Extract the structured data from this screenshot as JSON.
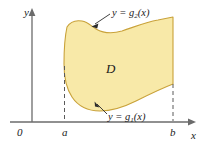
{
  "figure": {
    "axes": {
      "y_axis_label": "y",
      "x_axis_label": "x",
      "origin_label": "0"
    },
    "ticks": {
      "left_bound": "a",
      "right_bound": "b"
    },
    "region": {
      "label": "D",
      "fill_color": "#F8E9A8",
      "stroke_color": "#C9A23A"
    },
    "curves": [
      {
        "name": "upper-curve",
        "label_prefix": "y = g",
        "label_subscript": "2",
        "label_suffix": "(x)"
      },
      {
        "name": "lower-curve",
        "label_prefix": "y = g",
        "label_subscript": "1",
        "label_suffix": "(x)"
      }
    ],
    "colors": {
      "axis": "#6b6b6b",
      "dashed": "#5a5a5a",
      "text": "#1a1a1a",
      "leader": "#2b2b2b"
    }
  }
}
